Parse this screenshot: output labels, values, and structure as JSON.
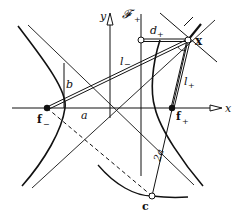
{
  "diagram": {
    "type": "hyperbola-focal-construction",
    "labels": {
      "y_axis": "y",
      "x_axis": "x",
      "directrix": "𝓕",
      "directrix_sub": "+",
      "d_plus": "d",
      "d_plus_sub": "+",
      "point_x": "x",
      "l_minus": "l",
      "l_minus_sub": "−",
      "l_plus": "l",
      "l_plus_sub": "+",
      "b": "b",
      "a": "a",
      "two_a": "2a",
      "f_minus": "f",
      "f_minus_sub": "−",
      "f_plus": "f",
      "f_plus_sub": "+",
      "c": "c"
    },
    "points": {
      "origin": [
        110,
        108
      ],
      "f_minus": [
        47,
        108
      ],
      "f_plus": [
        172,
        108
      ],
      "x": [
        188,
        40
      ],
      "directrix_foot": [
        141,
        40
      ],
      "c": [
        152,
        196
      ]
    },
    "colors": {
      "ink": "#111111",
      "background": "#ffffff"
    }
  }
}
